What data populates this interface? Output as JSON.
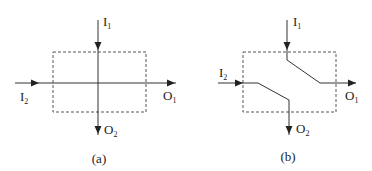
{
  "panels": [
    {
      "id": "a",
      "caption": "(a)",
      "description": "crossing paths: I1 passes straight down to O2, I2 passes straight right to O1",
      "labels": {
        "I1": {
          "main": "I",
          "sub": "1"
        },
        "I2": {
          "main": "I",
          "sub": "2"
        },
        "O1": {
          "main": "O",
          "sub": "1"
        },
        "O2": {
          "main": "O",
          "sub": "2"
        }
      }
    },
    {
      "id": "b",
      "caption": "(b)",
      "description": "swapped paths: I1 bends down-right to O1, I2 bends down to O2",
      "labels": {
        "I1": {
          "main": "I",
          "sub": "1"
        },
        "I2": {
          "main": "I",
          "sub": "2"
        },
        "O1": {
          "main": "O",
          "sub": "1"
        },
        "O2": {
          "main": "O",
          "sub": "2"
        }
      }
    }
  ],
  "colors": {
    "line": "#333333",
    "box": "#444444",
    "text": "#222222"
  }
}
